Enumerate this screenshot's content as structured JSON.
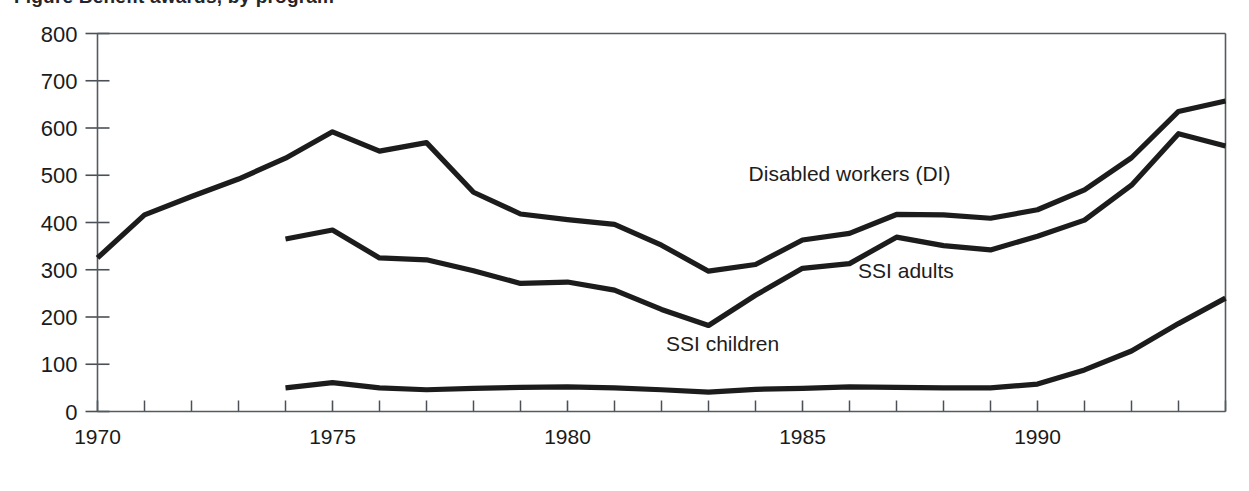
{
  "figure": {
    "title_fragment": "Figure  Benefit awards, by program",
    "background_color": "#ffffff",
    "line_color": "#1c1c1c",
    "axis_color": "#555a60"
  },
  "chart_data": {
    "type": "line",
    "title": "",
    "xlabel": "",
    "ylabel": "",
    "xlim": [
      1970,
      1994
    ],
    "ylim": [
      0,
      800
    ],
    "ytick_values": [
      0,
      100,
      200,
      300,
      400,
      500,
      600,
      700,
      800
    ],
    "ytick_labels": [
      "0",
      "100",
      "200",
      "300",
      "400",
      "500",
      "600",
      "700",
      "800"
    ],
    "xtick_major_values": [
      1970,
      1975,
      1980,
      1985,
      1990
    ],
    "xtick_major_labels": [
      "1970",
      "1975",
      "1980",
      "1985",
      "1990"
    ],
    "xtick_minor_values": [
      1971,
      1972,
      1973,
      1974,
      1976,
      1977,
      1978,
      1979,
      1981,
      1982,
      1983,
      1984,
      1986,
      1987,
      1988,
      1989,
      1991,
      1992,
      1993,
      1994
    ],
    "grid": false,
    "legend_position": "inline-annotations",
    "series": [
      {
        "name": "Disabled workers (DI)",
        "label_x": 1986.0,
        "label_y": 487,
        "x": [
          1970,
          1971,
          1972,
          1973,
          1974,
          1975,
          1976,
          1977,
          1978,
          1979,
          1980,
          1981,
          1982,
          1983,
          1984,
          1985,
          1986,
          1987,
          1988,
          1989,
          1990,
          1991,
          1992,
          1993,
          1994
        ],
        "y": [
          325,
          416,
          455,
          492,
          536,
          592,
          551,
          569,
          464,
          418,
          406,
          396,
          352,
          297,
          311,
          363,
          377,
          417,
          416,
          409,
          427,
          469,
          537,
          635,
          657
        ]
      },
      {
        "name": "SSI adults",
        "label_x": 1987.2,
        "label_y": 283,
        "x": [
          1974,
          1975,
          1976,
          1977,
          1978,
          1979,
          1980,
          1981,
          1982,
          1983,
          1984,
          1985,
          1986,
          1987,
          1988,
          1989,
          1990,
          1991,
          1992,
          1993,
          1994
        ],
        "y": [
          365,
          384,
          325,
          321,
          298,
          271,
          274,
          257,
          216,
          182,
          246,
          303,
          313,
          369,
          351,
          342,
          371,
          405,
          479,
          588,
          562
        ]
      },
      {
        "name": "SSI children",
        "label_x": 1983.3,
        "label_y": 128,
        "x": [
          1974,
          1975,
          1976,
          1977,
          1978,
          1979,
          1980,
          1981,
          1982,
          1983,
          1984,
          1985,
          1986,
          1987,
          1988,
          1989,
          1990,
          1991,
          1992,
          1993,
          1994
        ],
        "y": [
          50,
          61,
          50,
          46,
          49,
          51,
          52,
          50,
          46,
          41,
          47,
          49,
          52,
          51,
          50,
          50,
          58,
          88,
          128,
          186,
          240
        ]
      }
    ]
  }
}
